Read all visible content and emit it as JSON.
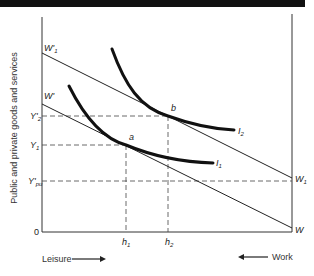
{
  "diagram": {
    "type": "indifference-curve budget-line diagram",
    "y_axis_label": "Public and private goods and services",
    "origin_label": "0",
    "bottom_left_label": "Leisure",
    "bottom_right_label": "Work",
    "colors": {
      "ink": "#1a1a1a",
      "background": "#ffffff",
      "top_bar": "#111111"
    },
    "lines": [
      {
        "id": "W1prime-W1",
        "start_label": "W'1",
        "end_label": "W1"
      },
      {
        "id": "Wprime-W",
        "start_label": "W'",
        "end_label": "W"
      }
    ],
    "curves": [
      {
        "id": "I1",
        "label": "I1"
      },
      {
        "id": "I2",
        "label": "I2"
      }
    ],
    "points": [
      {
        "id": "a",
        "label": "a"
      },
      {
        "id": "b",
        "label": "b"
      }
    ],
    "y_ticks": [
      {
        "main": "Y'",
        "sub": "2"
      },
      {
        "main": "Y",
        "sub": "1"
      },
      {
        "main": "Y'",
        "sub": "pu"
      }
    ],
    "x_ticks": [
      {
        "main": "h",
        "sub": "1"
      },
      {
        "main": "h",
        "sub": "2"
      }
    ],
    "line_labels": {
      "w1prime_main": "W'",
      "w1prime_sub": "1",
      "wprime_main": "W'",
      "w1_main": "W",
      "w1_sub": "1",
      "w_main": "W"
    },
    "curve_labels": {
      "i1_main": "I",
      "i1_sub": "1",
      "i2_main": "I",
      "i2_sub": "2"
    }
  }
}
